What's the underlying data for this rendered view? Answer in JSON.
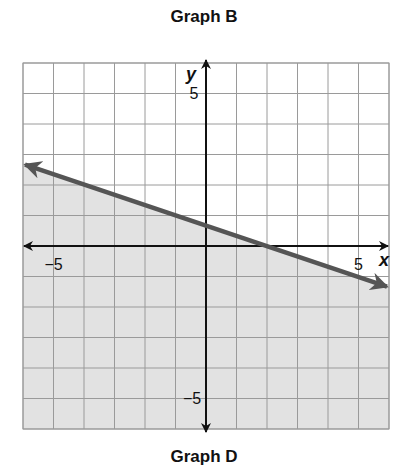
{
  "header": {
    "title": "Graph B"
  },
  "footer": {
    "caption": "Graph D"
  },
  "colors": {
    "shade": "#e2e2e2",
    "grid": "#9a9a9a",
    "axis": "#111111",
    "boundary_line": "#555555",
    "background": "#ffffff"
  },
  "chart_data": {
    "type": "line",
    "title": "Graph B",
    "caption_below": "Graph D",
    "xlabel": "x",
    "ylabel": "y",
    "xlim": [
      -6,
      6
    ],
    "ylim": [
      -6,
      6
    ],
    "grid": true,
    "grid_step": 1,
    "tick_labels": {
      "x": [
        "-5",
        "5"
      ],
      "y": [
        "5",
        "-5"
      ]
    },
    "series": [
      {
        "name": "boundary line",
        "equation": "y = -x/3 + 2/3",
        "style": "solid",
        "arrows": "both",
        "x": [
          -6,
          -1,
          2,
          6
        ],
        "y": [
          2.67,
          1,
          0,
          -1.33
        ]
      }
    ],
    "shaded_region": "below line",
    "inequality": "y <= -x/3 + 2/3",
    "legend": null
  }
}
